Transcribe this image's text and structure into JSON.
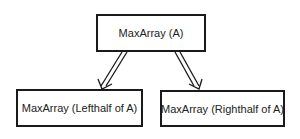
{
  "diagram": {
    "type": "recursion-tree",
    "nodes": {
      "root": {
        "label": "MaxArray (A)"
      },
      "left": {
        "label": "MaxArray (Lefthalf of A)"
      },
      "right": {
        "label": "MaxArray (Righthalf of  A)"
      }
    },
    "edges": [
      {
        "from": "root",
        "to": "left",
        "style": "double-line-arrow"
      },
      {
        "from": "root",
        "to": "right",
        "style": "double-line-arrow"
      }
    ],
    "colors": {
      "stroke": "#1a1a1a",
      "background": "#ffffff",
      "text": "#222222"
    }
  }
}
